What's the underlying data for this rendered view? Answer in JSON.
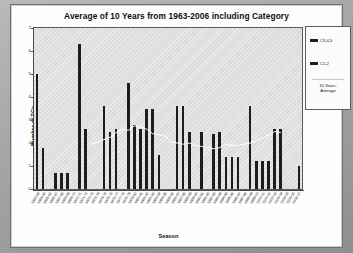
{
  "chart": {
    "title": "Average of 10 Years from 1963-2006 including Category",
    "xlabel": "Season",
    "ylabel": "Number of TCs"
  },
  "legend": {
    "entries": [
      {
        "label": "C3,4,5",
        "color": "#1d1d1d",
        "icon": "legend-swatch-icon"
      },
      {
        "label": "C1,2",
        "color": "#1d1d1d",
        "icon": "legend-swatch-icon"
      }
    ],
    "average_line_label": "10 Years-\nAverage"
  },
  "chart_data": {
    "type": "bar",
    "title": "Average of 10 Years from 1963-2006 including Category",
    "xlabel": "Season",
    "ylabel": "Number of TCs",
    "ylim": [
      0,
      7
    ],
    "yticks": [
      0,
      1,
      2,
      3,
      4,
      5,
      6,
      7
    ],
    "grid": false,
    "legend_position": "right",
    "categories": [
      "1963-64",
      "1964-65",
      "1965-66",
      "1966-67",
      "1967-68",
      "1968-69",
      "1969-70",
      "1970-71",
      "1971-72",
      "1972-73",
      "1973-74",
      "1974-75",
      "1975-76",
      "1976-77",
      "1977-78",
      "1978-79",
      "1979-80",
      "1980-81",
      "1981-82",
      "1982-83",
      "1983-84",
      "1984-85",
      "1985-86",
      "1986-87",
      "1987-88",
      "1988-89",
      "1989-90",
      "1990-91",
      "1991-92",
      "1992-93",
      "1993-94",
      "1994-95",
      "1995-96",
      "1996-97",
      "1997-98",
      "1998-99",
      "1999-00",
      "2000-01",
      "2001-02",
      "2002-03",
      "2003-04",
      "2004-05",
      "2005-06",
      "2006-07"
    ],
    "series": [
      {
        "name": "C3,4,5",
        "values": [
          5.0,
          1.8,
          0.0,
          0.7,
          0.7,
          0.7,
          0.0,
          6.3,
          2.6,
          0.0,
          0.0,
          3.6,
          2.5,
          2.6,
          0.0,
          4.6,
          2.8,
          2.6,
          3.5,
          3.5,
          1.5,
          0.0,
          0.0,
          3.6,
          3.6,
          2.5,
          0.0,
          2.5,
          0.0,
          2.4,
          2.5,
          1.4,
          1.4,
          1.4,
          0.0,
          3.6,
          1.2,
          1.2,
          1.2,
          2.6,
          2.6,
          0.0,
          0.0,
          1.0
        ]
      }
    ],
    "average_line": {
      "name": "10 Years-Average",
      "color": "#ffffff",
      "values": [
        null,
        null,
        null,
        null,
        null,
        null,
        null,
        null,
        null,
        1.95,
        2.05,
        2.15,
        2.25,
        2.45,
        2.6,
        2.55,
        2.75,
        2.7,
        2.6,
        2.4,
        2.35,
        2.3,
        2.05,
        2.0,
        1.95,
        2.0,
        1.9,
        1.85,
        1.8,
        1.75,
        1.8,
        1.95,
        1.9,
        1.9,
        1.95,
        2.0,
        2.1,
        2.2,
        2.35,
        2.5,
        2.45,
        null,
        null,
        null
      ]
    }
  }
}
